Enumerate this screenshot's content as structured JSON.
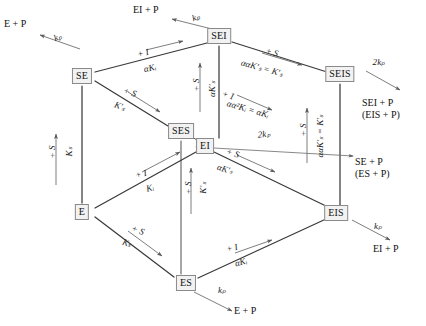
{
  "diagram": {
    "stroke_color": "#3a3a3a",
    "box_fill": "#f2f2f2",
    "box_border": "#8a8a8a",
    "nodes": [
      {
        "id": "SE",
        "label": "SE",
        "x": 82,
        "y": 76
      },
      {
        "id": "SEI",
        "label": "SEI",
        "x": 219,
        "y": 36
      },
      {
        "id": "SES",
        "label": "SES",
        "x": 181,
        "y": 131
      },
      {
        "id": "SEIS",
        "label": "SEIS",
        "x": 340,
        "y": 74
      },
      {
        "id": "EI",
        "label": "EI",
        "x": 205,
        "y": 146
      },
      {
        "id": "E",
        "label": "E",
        "x": 82,
        "y": 212
      },
      {
        "id": "ES",
        "label": "ES",
        "x": 186,
        "y": 283
      },
      {
        "id": "EIS",
        "label": "EIS",
        "x": 336,
        "y": 213
      }
    ],
    "edge_labels": [
      {
        "id": "se-sei-top",
        "top": "+ I",
        "bottom": "αKᵢ",
        "angle": -13,
        "x": 150,
        "y": 55
      },
      {
        "id": "sei-seis-top",
        "top": "+ S",
        "bottom": "ααK′ₛ = K′ₛ",
        "angle": 15,
        "x": 277,
        "y": 63
      },
      {
        "id": "se-ses",
        "top": "+ S",
        "bottom": "K′ₛ",
        "angle": 19,
        "x": 132,
        "y": 99
      },
      {
        "id": "ei-eis-mid",
        "top": "+ I",
        "bottom": "αα²Kᵢ = αKᵢ",
        "angle": 16,
        "x": 252,
        "y": 102
      },
      {
        "id": "e-ei",
        "top": "+ I",
        "bottom": "Kᵢ",
        "angle": -14,
        "x": 148,
        "y": 177
      },
      {
        "id": "e-es",
        "top": "+ S",
        "bottom": "Kₛ",
        "angle": 21,
        "x": 136,
        "y": 235
      },
      {
        "id": "es-eis",
        "top": "+ I",
        "bottom": "αKᵢ",
        "angle": -14,
        "x": 251,
        "y": 250
      },
      {
        "id": "ei-eis-inner",
        "top": "+ S",
        "bottom": "αK′ₛ",
        "angle": 17,
        "x": 249,
        "y": 165
      }
    ],
    "vertical_labels": [
      {
        "id": "se-e-plusS",
        "text": "+ S",
        "x": 52,
        "y": 150
      },
      {
        "id": "se-e-Ks",
        "text": "Kₛ",
        "x": 69,
        "y": 150
      },
      {
        "id": "sei-ei-plusS",
        "text": "+ S",
        "x": 196,
        "y": 83
      },
      {
        "id": "sei-ei-aKs",
        "text": "αK′ₛ",
        "x": 212,
        "y": 87
      },
      {
        "id": "ses-es-plusS",
        "text": "+ S",
        "x": 188,
        "y": 186
      },
      {
        "id": "ses-es-Ks",
        "text": "K′ₛ",
        "x": 203,
        "y": 186
      },
      {
        "id": "seis-eis-plusS",
        "text": "+ S",
        "x": 303,
        "y": 128
      },
      {
        "id": "seis-eis-Ks",
        "text": "ααK′ₛ = K′ₛ",
        "x": 320,
        "y": 133
      }
    ],
    "rate_labels": [
      {
        "id": "kp-E-P",
        "text": "kₚ",
        "x": 58,
        "y": 37,
        "angle": -22
      },
      {
        "id": "kp-EI-P",
        "text": "kₚ",
        "x": 196,
        "y": 17,
        "angle": -20
      },
      {
        "id": "twokp-SEIS",
        "text": "2kₚ",
        "x": 379,
        "y": 62,
        "angle": 0
      },
      {
        "id": "twokp-SES",
        "text": "2kₚ",
        "x": 264,
        "y": 134,
        "angle": -6
      },
      {
        "id": "kp-EIS",
        "text": "kₚ",
        "x": 378,
        "y": 226,
        "angle": 0
      },
      {
        "id": "kp-ES",
        "text": "kₚ",
        "x": 222,
        "y": 290,
        "angle": 0
      }
    ],
    "products": [
      {
        "id": "prod-E-P-topleft",
        "line1": "E + P",
        "line2": "",
        "x": 4,
        "y": 18
      },
      {
        "id": "prod-EI-P-top",
        "line1": "EI + P",
        "line2": "",
        "x": 133,
        "y": 4
      },
      {
        "id": "prod-SEI-P",
        "line1": "SEI + P",
        "line2": "(EIS + P)",
        "x": 362,
        "y": 97
      },
      {
        "id": "prod-SE-P",
        "line1": "SE + P",
        "line2": "(ES + P)",
        "x": 355,
        "y": 156
      },
      {
        "id": "prod-EI-P-right",
        "line1": "EI + P",
        "line2": "",
        "x": 373,
        "y": 243
      },
      {
        "id": "prod-E-P-bottom",
        "line1": "E + P",
        "line2": "",
        "x": 234,
        "y": 305
      }
    ]
  }
}
